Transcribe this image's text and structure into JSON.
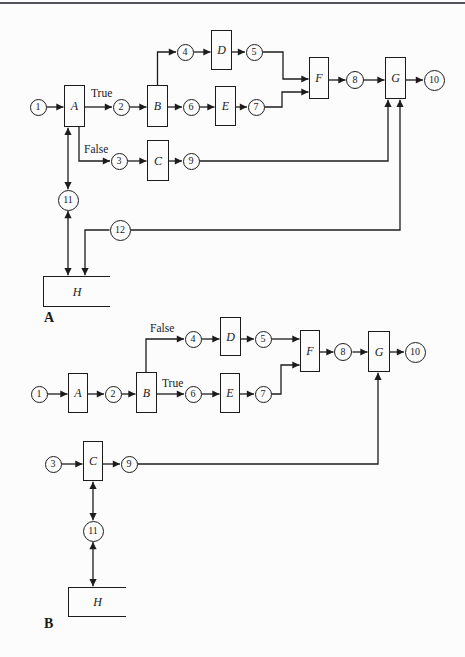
{
  "colors": {
    "background": "#fcfcfc",
    "line": "#1c1c1c",
    "top_rule": "#53545a"
  },
  "figure_a": {
    "caption": "A",
    "nodes": {
      "n1": "1",
      "n2": "2",
      "n3": "3",
      "n4": "4",
      "n5": "5",
      "n6": "6",
      "n7": "7",
      "n8": "8",
      "n9": "9",
      "n10": "10",
      "n11": "11",
      "n12": "12"
    },
    "blocks": {
      "a": "A",
      "b": "B",
      "c": "C",
      "d": "D",
      "e": "E",
      "f": "F",
      "g": "G",
      "h": "H"
    },
    "edge_labels": {
      "true_label": "True",
      "false_label": "False"
    }
  },
  "figure_b": {
    "caption": "B",
    "nodes": {
      "n1": "1",
      "n2": "2",
      "n3": "3",
      "n4": "4",
      "n5": "5",
      "n6": "6",
      "n7": "7",
      "n8": "8",
      "n9": "9",
      "n10": "10",
      "n11": "11"
    },
    "blocks": {
      "a": "A",
      "b": "B",
      "c": "C",
      "d": "D",
      "e": "E",
      "f": "F",
      "g": "G",
      "h": "H"
    },
    "edge_labels": {
      "true_label": "True",
      "false_label": "False"
    }
  }
}
